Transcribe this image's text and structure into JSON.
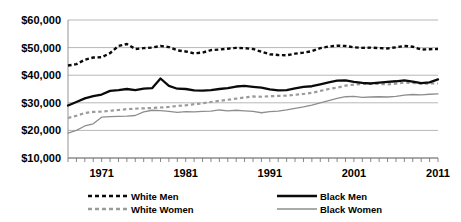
{
  "chart_data": {
    "type": "line",
    "title": "",
    "xlabel": "",
    "ylabel": "",
    "ylim": [
      10000,
      60000
    ],
    "xlim": [
      1967,
      2011
    ],
    "grid": true,
    "legend_position": "bottom",
    "ytick_labels": [
      "$60,000",
      "$50,000",
      "$40,000",
      "$30,000",
      "$20,000",
      "$10,000"
    ],
    "ytick_values": [
      60000,
      50000,
      40000,
      30000,
      20000,
      10000
    ],
    "xtick_labels": [
      "1971",
      "1981",
      "1991",
      "2001",
      "2011"
    ],
    "xtick_values": [
      1971,
      1981,
      1991,
      2001,
      2011
    ],
    "x": [
      1967,
      1968,
      1969,
      1970,
      1971,
      1972,
      1973,
      1974,
      1975,
      1976,
      1977,
      1978,
      1979,
      1980,
      1981,
      1982,
      1983,
      1984,
      1985,
      1986,
      1987,
      1988,
      1989,
      1990,
      1991,
      1992,
      1993,
      1994,
      1995,
      1996,
      1997,
      1998,
      1999,
      2000,
      2001,
      2002,
      2003,
      2004,
      2005,
      2006,
      2007,
      2008,
      2009,
      2010,
      2011
    ],
    "series": [
      {
        "name": "White Men",
        "color": "#0a0a0a",
        "style": "dashed",
        "width": "bold",
        "values": [
          43500,
          44000,
          45600,
          46400,
          46500,
          48000,
          50600,
          51300,
          49500,
          49800,
          50000,
          50600,
          50200,
          49000,
          48600,
          47900,
          48200,
          49100,
          49300,
          49600,
          49900,
          49800,
          49500,
          48500,
          47600,
          47300,
          47200,
          47800,
          48200,
          48700,
          49800,
          50400,
          50700,
          50600,
          50100,
          49900,
          50000,
          49800,
          49700,
          50100,
          50600,
          50300,
          49300,
          49400,
          49500
        ]
      },
      {
        "name": "Black Men",
        "color": "#0a0a0a",
        "style": "solid",
        "width": "bold",
        "values": [
          29000,
          30300,
          31600,
          32400,
          33000,
          34300,
          34600,
          35000,
          34600,
          35100,
          35300,
          38800,
          36100,
          35100,
          35000,
          34500,
          34400,
          34600,
          35000,
          35300,
          35900,
          36100,
          35800,
          35500,
          34900,
          34500,
          34600,
          35200,
          35800,
          36000,
          36700,
          37400,
          38000,
          38100,
          37600,
          37200,
          37000,
          37300,
          37600,
          37800,
          38100,
          37700,
          37100,
          37400,
          38500
        ]
      },
      {
        "name": "White Women",
        "color": "#9b9b9b",
        "style": "dashed",
        "width": "medium",
        "values": [
          24500,
          25300,
          26300,
          26700,
          26800,
          27100,
          27400,
          27700,
          27900,
          28000,
          28100,
          28300,
          28500,
          28900,
          29100,
          29500,
          29800,
          30300,
          30700,
          31100,
          31500,
          31900,
          32300,
          32200,
          32400,
          32500,
          32600,
          32900,
          33200,
          33600,
          34300,
          35000,
          35500,
          36200,
          36600,
          36800,
          36900,
          36800,
          36700,
          36900,
          37300,
          37200,
          36900,
          37000,
          37000
        ]
      },
      {
        "name": "Black Women",
        "color": "#8e8e8e",
        "style": "solid",
        "width": "thin",
        "values": [
          19000,
          20000,
          21600,
          22400,
          24800,
          25000,
          25100,
          25200,
          25400,
          26700,
          27300,
          27200,
          26900,
          26500,
          26800,
          26700,
          26900,
          27000,
          27400,
          27100,
          27300,
          27100,
          26900,
          26400,
          26800,
          27000,
          27400,
          28000,
          28500,
          29200,
          30000,
          30800,
          31600,
          32200,
          32300,
          32000,
          32100,
          32200,
          32100,
          32300,
          32800,
          33000,
          32900,
          33100,
          33200
        ]
      }
    ]
  },
  "legend": {
    "items": [
      {
        "label": "White Men",
        "key": "white-men"
      },
      {
        "label": "White Women",
        "key": "white-women"
      },
      {
        "label": "Black Men",
        "key": "black-men"
      },
      {
        "label": "Black Women",
        "key": "black-women"
      }
    ]
  }
}
